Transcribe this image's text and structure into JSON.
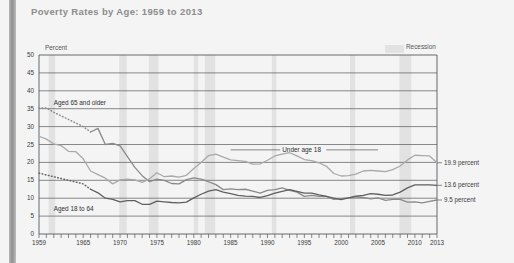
{
  "page_title": "Poverty Rates by Age: 1959 to 2013",
  "axis": {
    "y_title": "Percent",
    "y_ticks": [
      "50",
      "45",
      "40",
      "35",
      "30",
      "25",
      "20",
      "15",
      "10",
      "5",
      "0"
    ],
    "x_ticks": [
      "1959",
      "1965",
      "1970",
      "1975",
      "1980",
      "1985",
      "1990",
      "1995",
      "2000",
      "2005",
      "2010",
      "2013"
    ]
  },
  "legend": {
    "recession_label": "Recession",
    "recession_color": "#e2e2e2"
  },
  "series_labels": {
    "aged65": "Aged 65 and older",
    "under18": "Under age 18",
    "aged18to64": "Aged 18 to 64"
  },
  "end_labels": {
    "under18": "19.9 percent",
    "aged18to64": "13.6 percent",
    "aged65": "9.5 percent"
  },
  "chart_data": {
    "type": "line",
    "title": "Poverty Rates by Age: 1959 to 2013",
    "xlabel": "",
    "ylabel": "Percent",
    "ylim": [
      0,
      50
    ],
    "xlim": [
      1959,
      2013
    ],
    "grid": true,
    "legend_position": "top-right",
    "annotations": [
      {
        "text": "Aged 65 and older",
        "x": 1961,
        "y": 36.5
      },
      {
        "text": "Under age 18",
        "x": 1992,
        "y": 23.5
      },
      {
        "text": "Aged 18 to 64",
        "x": 1961,
        "y": 7.0
      },
      {
        "text": "19.9 percent",
        "x": 2014,
        "y": 19.9
      },
      {
        "text": "13.6 percent",
        "x": 2014,
        "y": 13.6
      },
      {
        "text": "9.5 percent",
        "x": 2014,
        "y": 9.5
      }
    ],
    "recession_bands": [
      {
        "start": 1960.3,
        "end": 1961.2
      },
      {
        "start": 1969.9,
        "end": 1970.9
      },
      {
        "start": 1973.9,
        "end": 1975.2
      },
      {
        "start": 1980.0,
        "end": 1980.6
      },
      {
        "start": 1981.5,
        "end": 1982.9
      },
      {
        "start": 1990.6,
        "end": 1991.2
      },
      {
        "start": 2001.2,
        "end": 2001.9
      },
      {
        "start": 2007.9,
        "end": 2009.5
      }
    ],
    "x": [
      1959,
      1960,
      1961,
      1962,
      1963,
      1964,
      1965,
      1966,
      1967,
      1968,
      1969,
      1970,
      1971,
      1972,
      1973,
      1974,
      1975,
      1976,
      1977,
      1978,
      1979,
      1980,
      1981,
      1982,
      1983,
      1984,
      1985,
      1986,
      1987,
      1988,
      1989,
      1990,
      1991,
      1992,
      1993,
      1994,
      1995,
      1996,
      1997,
      1998,
      1999,
      2000,
      2001,
      2002,
      2003,
      2004,
      2005,
      2006,
      2007,
      2008,
      2009,
      2010,
      2011,
      2012,
      2013
    ],
    "series": [
      {
        "name": "Aged 65 and older",
        "color": "#8a8a8a",
        "dashed_range": [
          1959,
          1966
        ],
        "values": [
          35.2,
          35.2,
          34.0,
          33.0,
          32.0,
          31.0,
          30.0,
          28.5,
          29.5,
          25.0,
          25.3,
          24.6,
          21.6,
          18.6,
          16.3,
          14.6,
          15.3,
          15.0,
          14.1,
          14.0,
          15.2,
          15.7,
          15.3,
          14.6,
          13.8,
          12.4,
          12.6,
          12.4,
          12.5,
          12.0,
          11.4,
          12.2,
          12.4,
          12.9,
          12.2,
          11.7,
          10.5,
          10.8,
          10.5,
          10.5,
          9.7,
          9.9,
          10.1,
          10.4,
          10.2,
          9.8,
          10.1,
          9.4,
          9.7,
          9.7,
          8.9,
          9.0,
          8.7,
          9.1,
          9.5
        ]
      },
      {
        "name": "Under age 18",
        "color": "#a9a9a9",
        "values": [
          27.3,
          26.5,
          25.2,
          24.7,
          23.1,
          23.0,
          21.0,
          17.6,
          16.6,
          15.6,
          14.0,
          15.1,
          15.3,
          15.1,
          14.4,
          15.4,
          17.1,
          16.0,
          16.2,
          15.9,
          16.4,
          18.3,
          20.0,
          21.9,
          22.3,
          21.5,
          20.7,
          20.5,
          20.3,
          19.5,
          19.6,
          20.6,
          21.8,
          22.3,
          22.7,
          21.8,
          20.8,
          20.5,
          19.9,
          18.9,
          16.9,
          16.2,
          16.3,
          16.7,
          17.6,
          17.8,
          17.6,
          17.4,
          18.0,
          19.0,
          20.7,
          22.0,
          21.9,
          21.8,
          19.9
        ]
      },
      {
        "name": "Aged 18 to 64",
        "color": "#5f5f5f",
        "dashed_range": [
          1959,
          1966
        ],
        "values": [
          17.0,
          16.5,
          16.0,
          15.5,
          15.0,
          14.5,
          14.0,
          12.5,
          11.5,
          10.0,
          9.7,
          9.0,
          9.3,
          9.3,
          8.3,
          8.3,
          9.2,
          9.0,
          8.8,
          8.7,
          8.9,
          10.1,
          11.1,
          12.0,
          12.4,
          11.7,
          11.3,
          10.8,
          10.6,
          10.5,
          10.2,
          10.7,
          11.4,
          11.9,
          12.4,
          11.9,
          11.4,
          11.4,
          10.9,
          10.5,
          10.0,
          9.6,
          10.1,
          10.6,
          10.8,
          11.3,
          11.1,
          10.8,
          10.9,
          11.7,
          12.9,
          13.7,
          13.7,
          13.7,
          13.6
        ]
      }
    ]
  }
}
